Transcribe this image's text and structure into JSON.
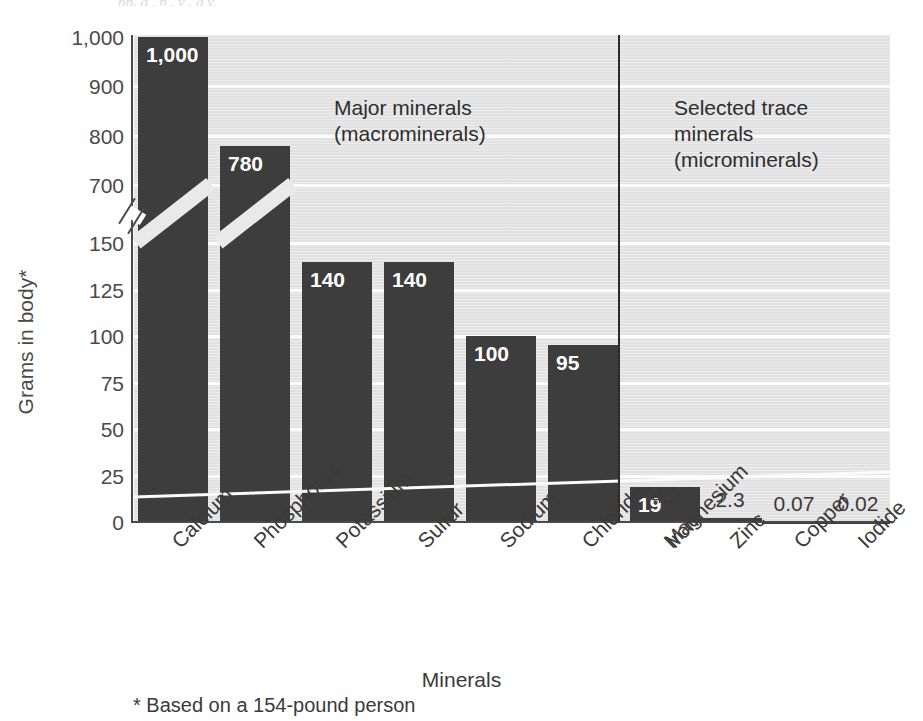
{
  "top_sliver_text": "pp, g    , p    , y          , g    y,",
  "axis": {
    "y_title": "Grams in body*",
    "x_title": "Minerals",
    "footnote": "* Based on a 154-pound person",
    "y_ticks": [
      "1,000",
      "900",
      "800",
      "700",
      "150",
      "125",
      "100",
      "75",
      "50",
      "25",
      "0"
    ]
  },
  "annotations": [
    {
      "name": "major-minerals",
      "line1": "Major minerals",
      "line2": "(macrominerals)"
    },
    {
      "name": "trace-minerals",
      "line1": "Selected trace minerals",
      "line2": "(microminerals)"
    }
  ],
  "colors": {
    "bar": "#3d3d3d",
    "plot_background": "#e4e4e4",
    "gridline": "#fcfcfc",
    "axis": "#4a4a4a",
    "divider": "#2b2b2b",
    "value_label_inside": "#ffffff",
    "value_label_outside": "#3a3a3a"
  },
  "chart_data": {
    "type": "bar",
    "title": "",
    "subtitle": "",
    "xlabel": "Minerals",
    "ylabel": "Grams in body*",
    "categories": [
      "Calcium",
      "Phosphorus",
      "Potassium",
      "Sulfur",
      "Sodium",
      "Chloride",
      "Magnesium",
      "Iron",
      "Zinc",
      "Copper",
      "Iodide"
    ],
    "values": [
      1000,
      780,
      140,
      140,
      100,
      95,
      19,
      4.2,
      2.3,
      0.07,
      0.02
    ],
    "value_labels": [
      "1,000",
      "780",
      "140",
      "140",
      "100",
      "95",
      "19",
      "4.2",
      "2.3",
      "0.07",
      "0.02"
    ],
    "groups": [
      {
        "name": "Major minerals (macrominerals)",
        "categories": [
          "Calcium",
          "Phosphorus",
          "Potassium",
          "Sulfur",
          "Sodium",
          "Chloride",
          "Magnesium"
        ]
      },
      {
        "name": "Selected trace minerals (microminerals)",
        "categories": [
          "Iron",
          "Zinc",
          "Copper",
          "Iodide"
        ]
      }
    ],
    "y_tick_values": [
      1000,
      900,
      800,
      700,
      150,
      125,
      100,
      75,
      50,
      25,
      0
    ],
    "y_tick_labels": [
      "1,000",
      "900",
      "800",
      "700",
      "150",
      "125",
      "100",
      "75",
      "50",
      "25",
      "0"
    ],
    "broken_axis": true,
    "axis_break_between": [
      150,
      700
    ],
    "ylim": [
      0,
      1000
    ],
    "grid": true,
    "legend": "none",
    "annotations": [
      "Major minerals (macrominerals)",
      "Selected trace minerals (microminerals)",
      "* Based on a 154-pound person"
    ]
  }
}
